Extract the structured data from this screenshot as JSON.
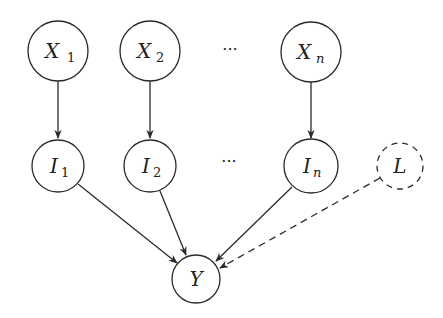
{
  "diagram": {
    "type": "directed-graph",
    "nodes": {
      "x1": {
        "label": "X",
        "sub": "1",
        "style": "solid"
      },
      "x2": {
        "label": "X",
        "sub": "2",
        "style": "solid"
      },
      "xn": {
        "label": "X",
        "sub": "n",
        "style": "solid"
      },
      "i1": {
        "label": "I",
        "sub": "1",
        "style": "solid"
      },
      "i2": {
        "label": "I",
        "sub": "2",
        "style": "solid"
      },
      "in": {
        "label": "I",
        "sub": "n",
        "style": "solid"
      },
      "l": {
        "label": "L",
        "sub": "",
        "style": "dashed"
      },
      "y": {
        "label": "Y",
        "sub": "",
        "style": "solid"
      }
    },
    "ellipsis_top": "···",
    "ellipsis_mid": "···",
    "edges": [
      {
        "from": "X1",
        "to": "I1",
        "style": "solid"
      },
      {
        "from": "X2",
        "to": "I2",
        "style": "solid"
      },
      {
        "from": "Xn",
        "to": "In",
        "style": "solid"
      },
      {
        "from": "I1",
        "to": "Y",
        "style": "solid"
      },
      {
        "from": "I2",
        "to": "Y",
        "style": "solid"
      },
      {
        "from": "In",
        "to": "Y",
        "style": "solid"
      },
      {
        "from": "L",
        "to": "Y",
        "style": "dashed"
      }
    ],
    "colors": {
      "stroke": "#2a2a2a",
      "background": "#ffffff"
    }
  }
}
